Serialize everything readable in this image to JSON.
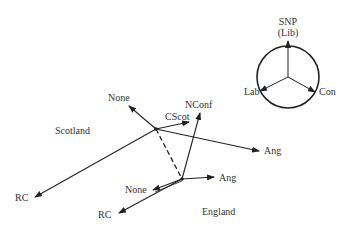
{
  "legend": {
    "top_label_1": "SNP",
    "top_label_2": "(Lib)",
    "left_label": "Lab",
    "right_label": "Con"
  },
  "regions": {
    "scotland": "Scotland",
    "england": "England"
  },
  "scotland_vectors": {
    "none": "None",
    "cscot": "CScot",
    "ang": "Ang",
    "rc": "RC"
  },
  "england_vectors": {
    "nconf": "NConf",
    "ang": "Ang",
    "none": "None",
    "rc": "RC"
  },
  "colors": {
    "stroke": "#222222",
    "text": "#333333"
  }
}
